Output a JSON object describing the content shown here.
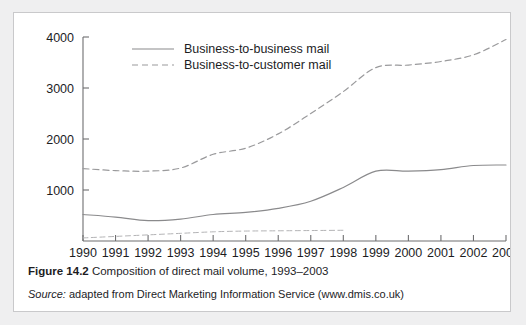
{
  "figure": {
    "caption_prefix": "Figure 14.2",
    "caption_text": "Composition of direct mail volume, 1993–2003",
    "source_prefix": "Source:",
    "source_text": "adapted from Direct Marketing Information Service (www.dmis.co.uk)"
  },
  "colors": {
    "page_background": "#efeff0",
    "figure_background": "#ffffff",
    "figure_border": "#c9c9cb",
    "axis": "#6e6e70",
    "text": "#1d1d1f",
    "series_b2b": "#8a8a8c",
    "series_b2c": "#9a9a9c",
    "series_other": "#b4b4b6"
  },
  "chart_data": {
    "type": "line",
    "title": "",
    "subtitle": "",
    "xlabel": "",
    "ylabel": "",
    "grid": false,
    "legend_position": "inside-top-left",
    "x": [
      1990,
      1991,
      1992,
      1993,
      1994,
      1995,
      1996,
      1997,
      1998,
      1999,
      2000,
      2001,
      2002,
      2003
    ],
    "categories": [
      "1990",
      "1991",
      "1992",
      "1993",
      "1994",
      "1995",
      "1996",
      "1997",
      "1998",
      "1999",
      "2000",
      "2001",
      "2002",
      "2003"
    ],
    "xlim": [
      1990,
      2003
    ],
    "ylim": [
      0,
      4000
    ],
    "yticks": [
      1000,
      2000,
      3000,
      4000
    ],
    "ytick_labels": [
      "1000",
      "2000",
      "3000",
      "4000"
    ],
    "xtick_labels": [
      "1990",
      "1991",
      "1992",
      "1993",
      "1994",
      "1995",
      "1996",
      "1997",
      "1998",
      "1999",
      "2000",
      "2001",
      "2002",
      "2003"
    ],
    "series": [
      {
        "name": "Business-to-business mail",
        "style": "solid",
        "values": [
          520,
          470,
          400,
          430,
          520,
          560,
          640,
          780,
          1050,
          1370,
          1370,
          1400,
          1480,
          1490
        ]
      },
      {
        "name": "Business-to-customer mail",
        "style": "dashed",
        "values": [
          1420,
          1380,
          1370,
          1430,
          1700,
          1820,
          2100,
          2500,
          2930,
          3400,
          3450,
          3520,
          3650,
          3950
        ]
      },
      {
        "name": "",
        "style": "dashed",
        "values": [
          60,
          90,
          120,
          150,
          180,
          195,
          200,
          205,
          210,
          null,
          null,
          null,
          null,
          null
        ]
      }
    ],
    "legend": [
      {
        "label": "Business-to-business mail",
        "style": "solid"
      },
      {
        "label": "Business-to-customer mail",
        "style": "dashed"
      }
    ]
  }
}
